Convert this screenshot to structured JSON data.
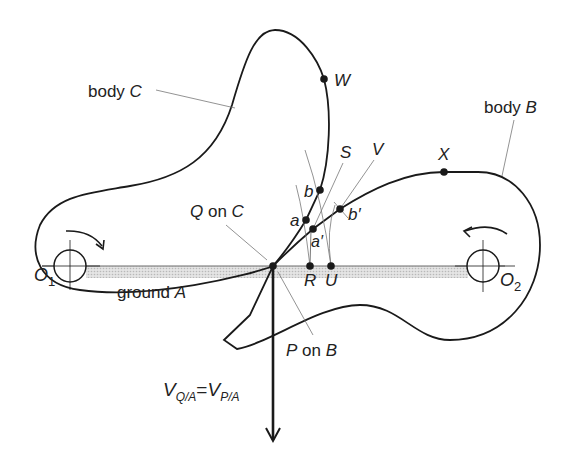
{
  "diagram": {
    "type": "kinematic contact diagram",
    "bodies": {
      "body_c": {
        "label_prefix": "body ",
        "label_var": "C"
      },
      "body_b": {
        "label_prefix": "body ",
        "label_var": "B"
      },
      "ground_a": {
        "label_prefix": "ground ",
        "label_var": "A"
      }
    },
    "pivots": {
      "o1": {
        "main": "O",
        "sub": "1"
      },
      "o2": {
        "main": "O",
        "sub": "2"
      }
    },
    "points": {
      "w": "W",
      "x": "X",
      "s": "S",
      "v": "V",
      "a": "a",
      "a_prime": "a′",
      "b": "b",
      "b_prime": "b′",
      "r": "R",
      "u": "U"
    },
    "contact_labels": {
      "q_on_c": {
        "var": "Q",
        "text": " on ",
        "body": "C"
      },
      "p_on_b": {
        "var": "P",
        "text": " on ",
        "body": "B"
      }
    },
    "velocity_label": {
      "v1": "V",
      "sub1": "Q/A",
      "eq": "=",
      "v2": "V",
      "sub2": "P/A"
    },
    "colors": {
      "stroke": "#1a1a1a",
      "leader": "#777777",
      "ground_fill": "#cfcfcf"
    }
  }
}
